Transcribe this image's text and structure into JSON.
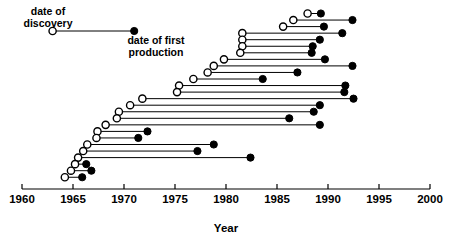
{
  "chart_data": {
    "type": "scatter",
    "subtype": "dumbbell-timeline",
    "title": "",
    "xlabel": "Year",
    "ylabel": "",
    "xlim": [
      1960,
      2000
    ],
    "ylim": [
      0,
      27
    ],
    "grid": false,
    "x_ticks": [
      1960,
      1965,
      1970,
      1975,
      1980,
      1985,
      1990,
      1995,
      2000
    ],
    "x_tick_labels": [
      "1960",
      "1965",
      "1970",
      "1975",
      "1980",
      "1985",
      "1990",
      "1995",
      "2000"
    ],
    "y_axis_visible": false,
    "legend": {
      "position": "top-left",
      "entries": [
        {
          "label": "date of discovery",
          "marker": "open-circle",
          "color": "#000000"
        },
        {
          "label": "date of first production",
          "marker": "filled-circle",
          "color": "#000000"
        }
      ]
    },
    "legend_sample_segment": {
      "discovery": 1963.0,
      "production": 1971.0
    },
    "series": [
      {
        "name": "date of discovery",
        "marker": "open-circle"
      },
      {
        "name": "date of first production",
        "marker": "filled-circle"
      }
    ],
    "marker_style": {
      "open_circle_radius_px": 3.6,
      "filled_circle_radius_px": 3.6,
      "line_width_px": 1.0,
      "line_color": "#000000"
    },
    "points": [
      {
        "row": 1,
        "discovery": 1988.0,
        "production": 1989.3
      },
      {
        "row": 2,
        "discovery": 1986.6,
        "production": 1992.4
      },
      {
        "row": 3,
        "discovery": 1985.6,
        "production": 1989.6
      },
      {
        "row": 4,
        "discovery": 1981.6,
        "production": 1991.4
      },
      {
        "row": 5,
        "discovery": 1981.6,
        "production": 1989.2
      },
      {
        "row": 6,
        "discovery": 1981.6,
        "production": 1988.5
      },
      {
        "row": 7,
        "discovery": 1981.4,
        "production": 1988.4
      },
      {
        "row": 8,
        "discovery": 1979.8,
        "production": 1989.7
      },
      {
        "row": 9,
        "discovery": 1978.8,
        "production": 1992.4
      },
      {
        "row": 10,
        "discovery": 1978.2,
        "production": 1987.0
      },
      {
        "row": 11,
        "discovery": 1976.8,
        "production": 1983.6
      },
      {
        "row": 12,
        "discovery": 1975.4,
        "production": 1991.7
      },
      {
        "row": 13,
        "discovery": 1975.2,
        "production": 1991.6
      },
      {
        "row": 14,
        "discovery": 1971.8,
        "production": 1992.5
      },
      {
        "row": 15,
        "discovery": 1970.6,
        "production": 1989.2
      },
      {
        "row": 16,
        "discovery": 1969.5,
        "production": 1988.6
      },
      {
        "row": 17,
        "discovery": 1969.3,
        "production": 1986.2
      },
      {
        "row": 18,
        "discovery": 1968.2,
        "production": 1989.2
      },
      {
        "row": 19,
        "discovery": 1967.4,
        "production": 1972.3
      },
      {
        "row": 20,
        "discovery": 1967.3,
        "production": 1971.4
      },
      {
        "row": 21,
        "discovery": 1966.4,
        "production": 1978.8
      },
      {
        "row": 22,
        "discovery": 1966.0,
        "production": 1977.2
      },
      {
        "row": 23,
        "discovery": 1965.5,
        "production": 1982.4
      },
      {
        "row": 24,
        "discovery": 1965.2,
        "production": 1966.3
      },
      {
        "row": 25,
        "discovery": 1964.8,
        "production": 1966.8
      },
      {
        "row": 26,
        "discovery": 1964.2,
        "production": 1965.9
      }
    ]
  },
  "legend": {
    "discovery_line1": "date of",
    "discovery_line2": "discovery",
    "production_line1": "date of first",
    "production_line2": "production"
  },
  "axis": {
    "title": "Year"
  }
}
